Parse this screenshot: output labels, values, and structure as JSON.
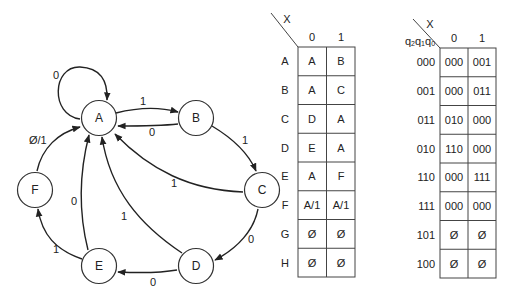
{
  "state_diagram": {
    "nodes": [
      {
        "id": "A",
        "label": "A",
        "cx": 99,
        "cy": 118
      },
      {
        "id": "B",
        "label": "B",
        "cx": 196,
        "cy": 118
      },
      {
        "id": "C",
        "label": "C",
        "cx": 262,
        "cy": 190
      },
      {
        "id": "D",
        "label": "D",
        "cx": 196,
        "cy": 266
      },
      {
        "id": "E",
        "label": "E",
        "cx": 99,
        "cy": 266
      },
      {
        "id": "F",
        "label": "F",
        "cx": 35,
        "cy": 190
      }
    ],
    "edges": [
      {
        "from": "A",
        "to": "A",
        "label": "0"
      },
      {
        "from": "A",
        "to": "B",
        "label": "1"
      },
      {
        "from": "B",
        "to": "A",
        "label": "0"
      },
      {
        "from": "B",
        "to": "C",
        "label": "1"
      },
      {
        "from": "C",
        "to": "A",
        "label": "1"
      },
      {
        "from": "C",
        "to": "D",
        "label": "0"
      },
      {
        "from": "D",
        "to": "A",
        "label": "1"
      },
      {
        "from": "D",
        "to": "E",
        "label": "0"
      },
      {
        "from": "E",
        "to": "A",
        "label": "0"
      },
      {
        "from": "E",
        "to": "F",
        "label": "1"
      },
      {
        "from": "F",
        "to": "A",
        "label": "Ø/1"
      }
    ]
  },
  "state_table": {
    "input_label": "X",
    "columns": [
      "0",
      "1"
    ],
    "rows": [
      {
        "state": "A",
        "next": [
          "A",
          "B"
        ]
      },
      {
        "state": "B",
        "next": [
          "A",
          "C"
        ]
      },
      {
        "state": "C",
        "next": [
          "D",
          "A"
        ]
      },
      {
        "state": "D",
        "next": [
          "E",
          "A"
        ]
      },
      {
        "state": "E",
        "next": [
          "A",
          "F"
        ]
      },
      {
        "state": "F",
        "next": [
          "A/1",
          "A/1"
        ]
      },
      {
        "state": "G",
        "next": [
          "Ø",
          "Ø"
        ]
      },
      {
        "state": "H",
        "next": [
          "Ø",
          "Ø"
        ]
      }
    ]
  },
  "encoded_table": {
    "input_label": "X",
    "state_vars_label": "q2q1q0",
    "columns": [
      "0",
      "1"
    ],
    "rows": [
      {
        "state": "000",
        "next": [
          "000",
          "001"
        ]
      },
      {
        "state": "001",
        "next": [
          "000",
          "011"
        ]
      },
      {
        "state": "011",
        "next": [
          "010",
          "000"
        ]
      },
      {
        "state": "010",
        "next": [
          "110",
          "000"
        ]
      },
      {
        "state": "110",
        "next": [
          "000",
          "111"
        ]
      },
      {
        "state": "111",
        "next": [
          "000",
          "000"
        ]
      },
      {
        "state": "101",
        "next": [
          "Ø",
          "Ø"
        ]
      },
      {
        "state": "100",
        "next": [
          "Ø",
          "Ø"
        ]
      }
    ]
  }
}
